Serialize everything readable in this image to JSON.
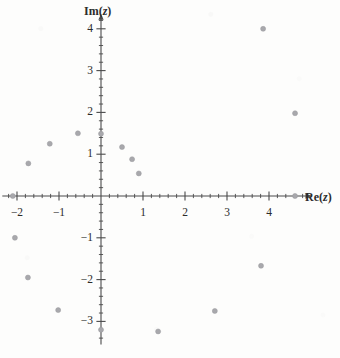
{
  "figure": {
    "kind": "argand-diagram",
    "background_color": "#fdfdfc",
    "axis_color": "#4a4a4a",
    "marker_color": "#a8a8ac",
    "label_color": "#2b2b2b"
  },
  "axis_labels": {
    "imaginary": "Im(z)",
    "imaginary_base": "Im(",
    "imaginary_var": "z",
    "imaginary_close": ")",
    "real": "Re(z)",
    "real_base": "Re(",
    "real_var": "z",
    "real_close": ")"
  },
  "chart_data": {
    "type": "scatter",
    "title": "",
    "xlabel": "Re(z)",
    "ylabel": "Im(z)",
    "xlim": [
      -2.35,
      5.0
    ],
    "ylim": [
      -3.55,
      4.35
    ],
    "grid": false,
    "legend": false,
    "axes_style": "centered-crosshair-with-arrows",
    "x_ticks_major": [
      -2,
      -1,
      1,
      2,
      3,
      4
    ],
    "y_ticks_major": [
      4,
      3,
      2,
      1,
      -1,
      -2,
      -3
    ],
    "x_tick_labels": [
      "−2",
      "−1",
      "1",
      "2",
      "3",
      "4"
    ],
    "y_tick_labels": [
      "4",
      "3",
      "2",
      "1",
      "−1",
      "−2",
      "−3"
    ],
    "minor_tick_step": 0.2,
    "marker": "filled-circle",
    "marker_size_px": 5,
    "series": [
      {
        "name": "roots",
        "points": [
          {
            "re": -2.1,
            "im": 0.0
          },
          {
            "re": -1.73,
            "im": 0.78
          },
          {
            "re": -1.22,
            "im": 1.25
          },
          {
            "re": -0.55,
            "im": 1.5
          },
          {
            "re": 0.0,
            "im": 1.49
          },
          {
            "re": 0.5,
            "im": 1.17
          },
          {
            "re": 0.74,
            "im": 0.88
          },
          {
            "re": 0.9,
            "im": 0.54
          },
          {
            "re": 3.86,
            "im": 4.0
          },
          {
            "re": 4.62,
            "im": 1.98
          },
          {
            "re": 4.62,
            "im": 0.0
          },
          {
            "re": -2.05,
            "im": -1.0
          },
          {
            "re": -1.74,
            "im": -1.95
          },
          {
            "re": -1.02,
            "im": -2.73
          },
          {
            "re": 0.0,
            "im": -3.2
          },
          {
            "re": 1.36,
            "im": -3.24
          },
          {
            "re": 2.71,
            "im": -2.75
          },
          {
            "re": 3.81,
            "im": -1.67
          }
        ]
      }
    ]
  }
}
